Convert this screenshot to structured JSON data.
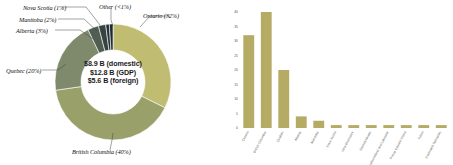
{
  "figure": {
    "title": "",
    "colors": {
      "ontario": "#c0bc72",
      "british_columbia": "#9aa06a",
      "quebec": "#7f8a6d",
      "alberta": "#4f5d52",
      "manitoba": "#35443f",
      "nova_scotia": "#263238",
      "other": "#1c2a33",
      "bar_fill": "#b5ab64",
      "axis": "#8a8a80",
      "text": "#111111"
    }
  },
  "donut": {
    "type": "pie",
    "center_lines": [
      "$8.9 B (domestic)",
      "$12.8 B (GDP)",
      "$5.6 B (foreign)"
    ],
    "labels": [
      "Ontario (32%)",
      "British Columbia (40%)",
      "Quebec (20%)",
      "Alberta (3%)",
      "Manitoba (2%)",
      "Nova Scotia (1%)",
      "Other (<1%)"
    ],
    "slices": [
      {
        "name": "Ontario",
        "label": "Ontario (32%)",
        "value": 32,
        "color": "#c0bc72"
      },
      {
        "name": "British Columbia",
        "label": "British Columbia (40%)",
        "value": 40,
        "color": "#9aa06a"
      },
      {
        "name": "Quebec",
        "label": "Quebec (20%)",
        "value": 20,
        "color": "#7f8a6d"
      },
      {
        "name": "Alberta",
        "label": "Alberta (3%)",
        "value": 3,
        "color": "#4f5d52"
      },
      {
        "name": "Manitoba",
        "label": "Manitoba (2%)",
        "value": 2,
        "color": "#35443f"
      },
      {
        "name": "Nova Scotia",
        "label": "Nova Scotia (1%)",
        "value": 1,
        "color": "#263238"
      },
      {
        "name": "Other",
        "label": "Other (<1%)",
        "value": 1,
        "color": "#1c2a33"
      }
    ]
  },
  "chart_data": {
    "type": "bar",
    "title": "",
    "xlabel": "",
    "ylabel": "",
    "ylim": [
      0,
      40
    ],
    "yticks": [
      0,
      5,
      10,
      15,
      20,
      25,
      30,
      35,
      40
    ],
    "grid": false,
    "legend": "none",
    "categories": [
      "Ontario",
      "British Columbia",
      "Quebec",
      "Alberta",
      "Manitoba",
      "Nova Scotia",
      "New Brunswick",
      "Saskatchewan",
      "Newfoundland and Labrador",
      "Prince Edward Island",
      "Yukon",
      "Northwest Territories"
    ],
    "values": [
      32,
      40,
      20,
      4,
      2.5,
      1,
      1,
      1,
      1,
      1,
      1,
      1
    ]
  }
}
